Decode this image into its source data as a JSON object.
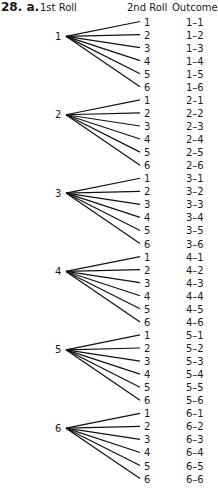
{
  "problem_label": "28. a.",
  "headers": {
    "first_roll": "1st Roll",
    "second_roll": "2nd Roll",
    "outcome": "Outcome"
  },
  "tree": [
    {
      "first": "1",
      "branches": [
        {
          "second": "1",
          "outcome": "1–1"
        },
        {
          "second": "2",
          "outcome": "1–2"
        },
        {
          "second": "3",
          "outcome": "1–3"
        },
        {
          "second": "4",
          "outcome": "1–4"
        },
        {
          "second": "5",
          "outcome": "1–5"
        },
        {
          "second": "6",
          "outcome": "1–6"
        }
      ]
    },
    {
      "first": "2",
      "branches": [
        {
          "second": "1",
          "outcome": "2–1"
        },
        {
          "second": "2",
          "outcome": "2–2"
        },
        {
          "second": "3",
          "outcome": "2–3"
        },
        {
          "second": "4",
          "outcome": "2–4"
        },
        {
          "second": "5",
          "outcome": "2–5"
        },
        {
          "second": "6",
          "outcome": "2–6"
        }
      ]
    },
    {
      "first": "3",
      "branches": [
        {
          "second": "1",
          "outcome": "3–1"
        },
        {
          "second": "2",
          "outcome": "3–2"
        },
        {
          "second": "3",
          "outcome": "3–3"
        },
        {
          "second": "4",
          "outcome": "3–4"
        },
        {
          "second": "5",
          "outcome": "3–5"
        },
        {
          "second": "6",
          "outcome": "3–6"
        }
      ]
    },
    {
      "first": "4",
      "branches": [
        {
          "second": "1",
          "outcome": "4–1"
        },
        {
          "second": "2",
          "outcome": "4–2"
        },
        {
          "second": "3",
          "outcome": "4–3"
        },
        {
          "second": "4",
          "outcome": "4–4"
        },
        {
          "second": "5",
          "outcome": "4–5"
        },
        {
          "second": "6",
          "outcome": "4–6"
        }
      ]
    },
    {
      "first": "5",
      "branches": [
        {
          "second": "1",
          "outcome": "5–1"
        },
        {
          "second": "2",
          "outcome": "5–2"
        },
        {
          "second": "3",
          "outcome": "5–3"
        },
        {
          "second": "4",
          "outcome": "5–4"
        },
        {
          "second": "5",
          "outcome": "5–5"
        },
        {
          "second": "6",
          "outcome": "5–6"
        }
      ]
    },
    {
      "first": "6",
      "branches": [
        {
          "second": "1",
          "outcome": "6–1"
        },
        {
          "second": "2",
          "outcome": "6–2"
        },
        {
          "second": "3",
          "outcome": "6–3"
        },
        {
          "second": "4",
          "outcome": "6–4"
        },
        {
          "second": "5",
          "outcome": "6–5"
        },
        {
          "second": "6",
          "outcome": "6–6"
        }
      ]
    }
  ]
}
